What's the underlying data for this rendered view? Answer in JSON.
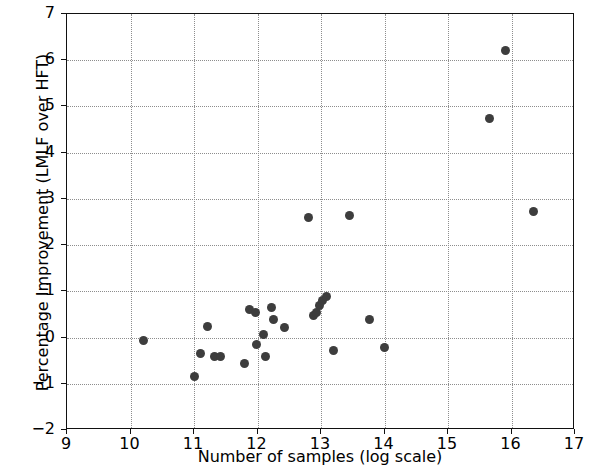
{
  "chart_data": {
    "type": "scatter",
    "title": "",
    "xlabel": "Number of samples (log scale)",
    "ylabel": "Percentage Improvement (LMLF over HFT)",
    "xlim": [
      9,
      17
    ],
    "ylim": [
      -2,
      7
    ],
    "xticks": [
      9,
      10,
      11,
      12,
      13,
      14,
      15,
      16,
      17
    ],
    "xtick_labels": [
      "9",
      "10",
      "11",
      "12",
      "13",
      "14",
      "15",
      "16",
      "17"
    ],
    "yticks": [
      -2,
      -1,
      0,
      1,
      2,
      3,
      4,
      5,
      6,
      7
    ],
    "ytick_labels": [
      "−2",
      "−1",
      "0",
      "1",
      "2",
      "3",
      "4",
      "5",
      "6",
      "7"
    ],
    "grid": true,
    "grid_style": "dotted",
    "legend": null,
    "marker": "circle",
    "marker_color": "#3d3d3d",
    "marker_size": 9,
    "points": [
      {
        "x": 10.2,
        "y": -0.07
      },
      {
        "x": 11.0,
        "y": -0.85
      },
      {
        "x": 11.1,
        "y": -0.35
      },
      {
        "x": 11.22,
        "y": 0.25
      },
      {
        "x": 11.32,
        "y": -0.42
      },
      {
        "x": 11.42,
        "y": -0.4
      },
      {
        "x": 11.8,
        "y": -0.57
      },
      {
        "x": 11.87,
        "y": 0.6
      },
      {
        "x": 11.97,
        "y": 0.55
      },
      {
        "x": 11.98,
        "y": -0.15
      },
      {
        "x": 12.1,
        "y": 0.07
      },
      {
        "x": 12.12,
        "y": -0.42
      },
      {
        "x": 12.22,
        "y": 0.65
      },
      {
        "x": 12.25,
        "y": 0.4
      },
      {
        "x": 12.42,
        "y": 0.22
      },
      {
        "x": 12.8,
        "y": 2.6
      },
      {
        "x": 12.88,
        "y": 0.48
      },
      {
        "x": 12.93,
        "y": 0.55
      },
      {
        "x": 12.97,
        "y": 0.7
      },
      {
        "x": 13.02,
        "y": 0.8
      },
      {
        "x": 13.08,
        "y": 0.88
      },
      {
        "x": 13.2,
        "y": -0.28
      },
      {
        "x": 13.45,
        "y": 2.65
      },
      {
        "x": 13.77,
        "y": 0.4
      },
      {
        "x": 14.0,
        "y": -0.22
      },
      {
        "x": 15.65,
        "y": 4.75
      },
      {
        "x": 15.9,
        "y": 6.2
      },
      {
        "x": 16.35,
        "y": 2.72
      }
    ]
  }
}
